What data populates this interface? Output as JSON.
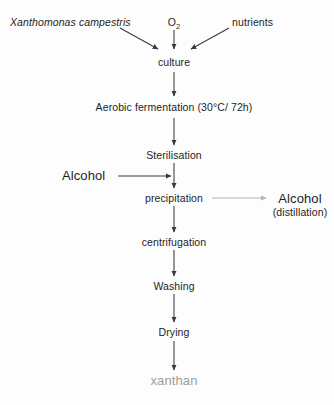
{
  "diagram": {
    "background_color": "#fdfdfd",
    "line_color": "#3a3a3a",
    "muted_line_color": "#b4b4b4",
    "text_color": "#1d1d1d",
    "muted_text_color": "#9d9d9d",
    "inputs": {
      "organism": "Xanthomonas campestris",
      "oxygen": "O",
      "oxygen_subscript": "2",
      "nutrients": "nutrients"
    },
    "steps": {
      "culture": "culture",
      "fermentation": "Aerobic fermentation (30°C/ 72h)",
      "sterilisation": "Sterilisation",
      "precipitation": "precipitation",
      "centrifugation": "centrifugation",
      "washing": "Washing",
      "drying": "Drying"
    },
    "reagent": {
      "alcohol_in": "Alcohol"
    },
    "byproduct": {
      "alcohol_out": "Alcohol",
      "alcohol_out_note": "(distillation)"
    },
    "product": {
      "xanthan": "xanthan"
    }
  }
}
